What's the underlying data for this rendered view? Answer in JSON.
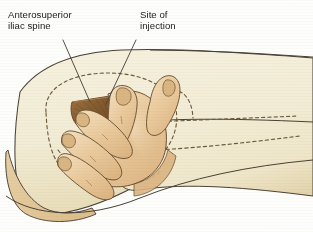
{
  "figure": {
    "background_color": "#ffffff",
    "canvas": {
      "width": 313,
      "height": 232
    }
  },
  "labels": [
    {
      "id": "anterosuperior-iliac-spine",
      "text": "Anterosuperior\niliac spine",
      "x": 8,
      "y": 9,
      "leader": {
        "from_x": 63,
        "from_y": 40,
        "to_x": 90,
        "to_y": 102
      }
    },
    {
      "id": "site-of-injection",
      "text": "Site of\ninjection",
      "x": 140,
      "y": 9,
      "leader": {
        "from_x": 136,
        "from_y": 40,
        "to_x": 106,
        "to_y": 104
      }
    }
  ],
  "colors": {
    "body_fill": "#f3eed7",
    "body_shadow": "#e6dcba",
    "hand_skin": "#e9c99b",
    "hand_skin_shadow": "#d9b07c",
    "hand_skin_highlight": "#f2dcba",
    "injection_triangle": "#8a6134",
    "injection_triangle_light": "#b58a55",
    "outline": "#4a4136",
    "dashed_bone": "#6b5b3e",
    "leader_line": "#4b4640",
    "label_text": "#1b1b1b",
    "page_white": "#ffffff"
  },
  "anatomy": {
    "dashed_landmarks": [
      {
        "name": "iliac-crest-outline",
        "style": "dashed"
      },
      {
        "name": "greater-trochanter",
        "style": "dashed"
      },
      {
        "name": "femur-shaft",
        "style": "dashed"
      }
    ],
    "hand": {
      "name": "clinician-hand",
      "fingers": 4,
      "thumb": true,
      "description": "palm on greater trochanter, index and middle finger spread forming V"
    },
    "injection_zone": {
      "name": "ventrogluteal-v-triangle",
      "shape": "triangle",
      "shading": "radial striations"
    }
  }
}
